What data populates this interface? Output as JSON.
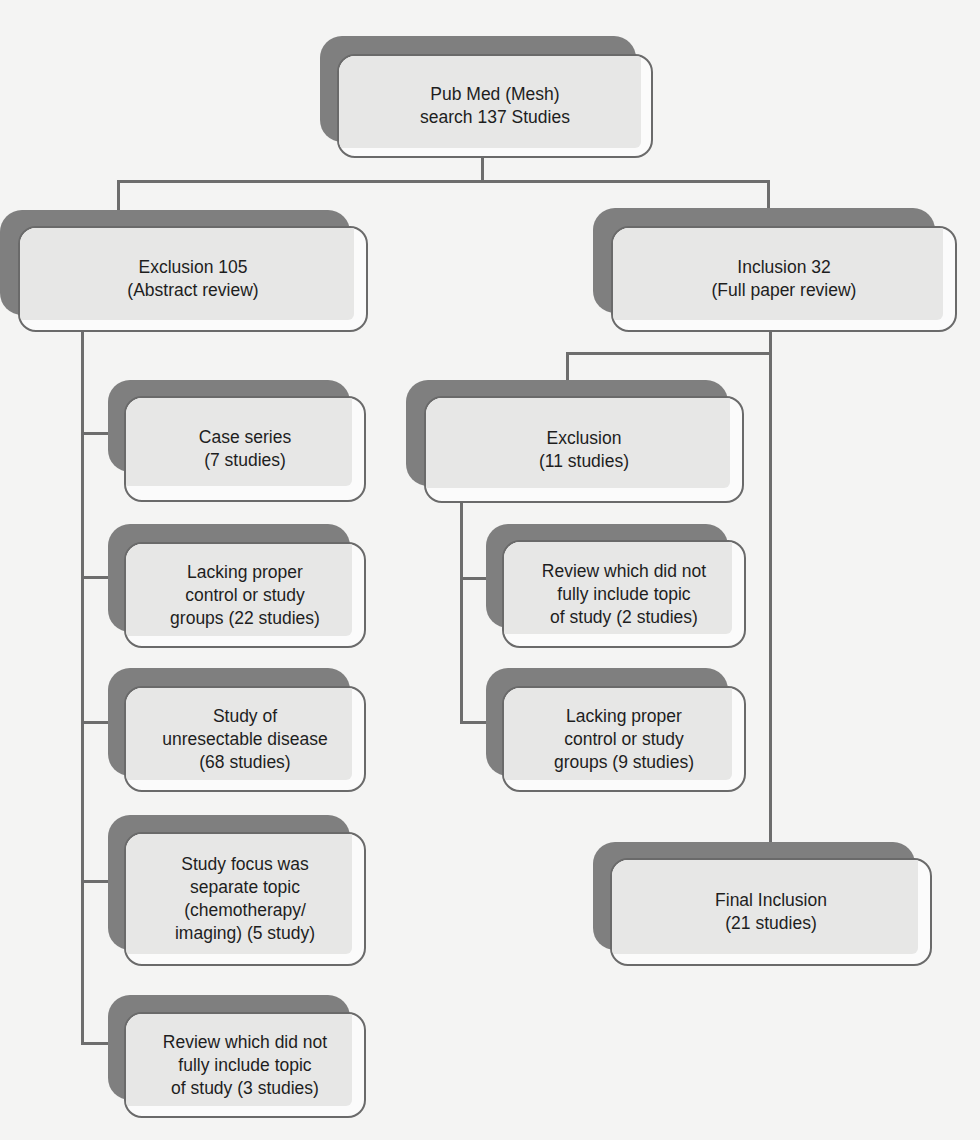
{
  "diagram": {
    "type": "flowchart",
    "nodes": {
      "search": {
        "label": "Pub Med (Mesh)\nsearch 137 Studies"
      },
      "exclusion_abstract": {
        "label": "Exclusion 105\n(Abstract review)"
      },
      "inclusion_fullpaper": {
        "label": "Inclusion 32\n(Full paper review)"
      },
      "case_series": {
        "label": "Case series\n(7 studies)"
      },
      "lacking_control_22": {
        "label": "Lacking proper\ncontrol or study\ngroups (22 studies)"
      },
      "unresectable": {
        "label": "Study of\nunresectable disease\n(68 studies)"
      },
      "separate_topic": {
        "label": "Study focus was\nseparate topic\n(chemotherapy/\nimaging) (5 study)"
      },
      "review_3": {
        "label": "Review which did not\nfully include topic\nof study (3 studies)"
      },
      "exclusion_11": {
        "label": "Exclusion\n(11 studies)"
      },
      "review_2": {
        "label": "Review which did not\nfully include topic\nof study (2 studies)"
      },
      "lacking_control_9": {
        "label": "Lacking proper\ncontrol or study\ngroups (9 studies)"
      },
      "final_inclusion": {
        "label": "Final Inclusion\n(21 studies)"
      }
    },
    "edges": [
      {
        "from": "search",
        "to": "exclusion_abstract"
      },
      {
        "from": "search",
        "to": "inclusion_fullpaper"
      },
      {
        "from": "exclusion_abstract",
        "to": "case_series"
      },
      {
        "from": "exclusion_abstract",
        "to": "lacking_control_22"
      },
      {
        "from": "exclusion_abstract",
        "to": "unresectable"
      },
      {
        "from": "exclusion_abstract",
        "to": "separate_topic"
      },
      {
        "from": "exclusion_abstract",
        "to": "review_3"
      },
      {
        "from": "inclusion_fullpaper",
        "to": "exclusion_11"
      },
      {
        "from": "inclusion_fullpaper",
        "to": "final_inclusion"
      },
      {
        "from": "exclusion_11",
        "to": "review_2"
      },
      {
        "from": "exclusion_11",
        "to": "lacking_control_9"
      }
    ],
    "colors": {
      "background": "#f4f4f3",
      "shadow": "#7f7f7f",
      "box_fill": "#e7e7e6",
      "box_border": "#6a6a6a",
      "connector": "#6d6d6d",
      "text": "#1e1e1e"
    }
  }
}
